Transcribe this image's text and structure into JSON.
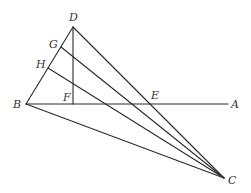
{
  "diagram": {
    "type": "geometry-figure",
    "stroke_color": "#2a2a2a",
    "label_color": "#333333",
    "points": {
      "D": {
        "label": "D",
        "x": 73,
        "y": 27
      },
      "G": {
        "label": "G",
        "x": 61,
        "y": 47
      },
      "H": {
        "label": "H",
        "x": 48,
        "y": 68
      },
      "B": {
        "label": "B",
        "x": 26,
        "y": 104
      },
      "F": {
        "label": "F",
        "x": 73,
        "y": 104
      },
      "E": {
        "label": "E",
        "x": 150,
        "y": 104
      },
      "A": {
        "label": "A",
        "x": 228,
        "y": 104
      },
      "C": {
        "label": "C",
        "x": 224,
        "y": 178
      }
    },
    "segments": [
      [
        "D",
        "B"
      ],
      [
        "D",
        "F"
      ],
      [
        "D",
        "C"
      ],
      [
        "B",
        "A"
      ],
      [
        "B",
        "C"
      ],
      [
        "G",
        "C"
      ],
      [
        "H",
        "C"
      ]
    ],
    "labels": {
      "D": "D",
      "G": "G",
      "H": "H",
      "B": "B",
      "F": "F",
      "E": "E",
      "A": "A",
      "C": "C"
    }
  }
}
